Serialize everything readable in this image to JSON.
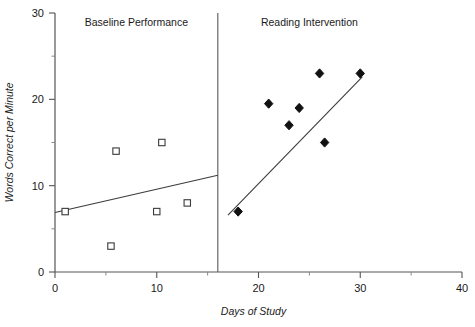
{
  "chart_data": {
    "type": "scatter",
    "title": "",
    "xlabel": "Days of Study",
    "ylabel": "Words Correct per Minute",
    "xlim": [
      0,
      40
    ],
    "ylim": [
      0,
      30
    ],
    "grid": false,
    "legend": "none",
    "x_ticks": [
      0,
      10,
      20,
      30,
      40
    ],
    "x_tick_labels": [
      "0",
      "10",
      "20",
      "30",
      "40"
    ],
    "x_minor_ticks": [
      5,
      15,
      25,
      35
    ],
    "y_ticks": [
      0,
      10,
      20,
      30
    ],
    "y_tick_labels": [
      "0",
      "10",
      "20",
      "30"
    ],
    "y_minor_ticks": [
      5,
      15,
      25
    ],
    "phase_change_x": 16,
    "annotations": [
      {
        "text": "Baseline Performance",
        "x": 8,
        "y": 28.5
      },
      {
        "text": "Reading Intervention",
        "x": 25,
        "y": 28.5
      }
    ],
    "series": [
      {
        "name": "Baseline Performance",
        "marker": "open-square",
        "points": [
          {
            "x": 1,
            "y": 7
          },
          {
            "x": 5.5,
            "y": 3
          },
          {
            "x": 6,
            "y": 14
          },
          {
            "x": 10,
            "y": 7
          },
          {
            "x": 10.5,
            "y": 15
          },
          {
            "x": 13,
            "y": 8
          }
        ],
        "trend_line": {
          "x1": 0,
          "y1": 6.9,
          "x2": 16,
          "y2": 11.2
        }
      },
      {
        "name": "Reading Intervention",
        "marker": "filled-diamond",
        "points": [
          {
            "x": 18,
            "y": 7
          },
          {
            "x": 21,
            "y": 19.5
          },
          {
            "x": 23,
            "y": 17
          },
          {
            "x": 24,
            "y": 19
          },
          {
            "x": 26,
            "y": 23
          },
          {
            "x": 26.5,
            "y": 15
          },
          {
            "x": 30,
            "y": 23
          }
        ],
        "trend_line": {
          "x1": 17,
          "y1": 6.6,
          "x2": 30.2,
          "y2": 22.6
        }
      }
    ]
  },
  "axis_titles": {
    "x": "Days of Study",
    "y": "Words Correct per Minute"
  }
}
